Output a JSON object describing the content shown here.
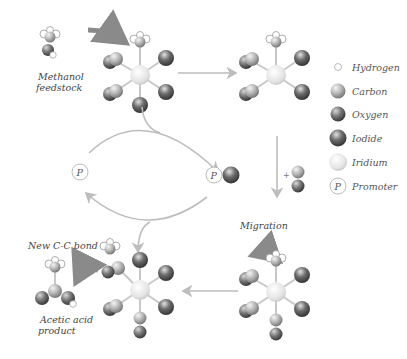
{
  "colors": {
    "arrow": "#bdbdbd",
    "bent_arrow": "#9a9a9a",
    "hydrogen": "#ffffff",
    "carbon": "#b9b9b9",
    "oxygen": "#6f6f6f",
    "iodide": "#5a5a5a",
    "iridium": "#e6e6e6"
  },
  "labels": {
    "methanol_line1": "Methanol",
    "methanol_line2": "feedstock",
    "migration": "Migration",
    "new_bond": "New C-C bond",
    "product_line1": "Acetic acid",
    "product_line2": "product",
    "plus": "+",
    "promoter_symbol": "P"
  },
  "legend": [
    {
      "key": "hydrogen",
      "label": "Hydrogen"
    },
    {
      "key": "carbon",
      "label": "Carbon"
    },
    {
      "key": "oxygen",
      "label": "Oxygen"
    },
    {
      "key": "iodide",
      "label": "Iodide"
    },
    {
      "key": "iridium",
      "label": "Iridium"
    },
    {
      "key": "promoter",
      "label": "Promoter",
      "symbol": "P"
    }
  ]
}
